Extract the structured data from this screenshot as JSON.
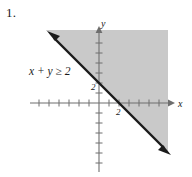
{
  "figure": {
    "problem_number": "1.",
    "inequality": {
      "lhs": "x + y",
      "operator": "≥",
      "rhs": "2",
      "full": "x + y ≥ 2"
    },
    "axes": {
      "x_label": "x",
      "y_label": "y",
      "x_intercept_label": "2",
      "y_intercept_label": "2"
    },
    "colors": {
      "shading": "#c9c9c9",
      "line": "#1a1a1a",
      "axis": "#6e6e6e",
      "text": "#1a1a1a",
      "background": "#ffffff"
    }
  },
  "chart_data": {
    "type": "line",
    "title": "x + y ≥ 2",
    "xlabel": "x",
    "ylabel": "y",
    "boundary_line": {
      "equation": "x + y = 2",
      "slope": -1,
      "intercept": 2,
      "style": "solid",
      "arrows": "both"
    },
    "points_labeled": [
      {
        "x": 0,
        "y": 2,
        "label": "2",
        "axis": "y"
      },
      {
        "x": 2,
        "y": 0,
        "label": "2",
        "axis": "x"
      }
    ],
    "shaded_region": "above-right of boundary line (x + y ≥ 2)",
    "xlim": [
      -7,
      7
    ],
    "ylim": [
      -7,
      7
    ],
    "grid": false,
    "legend": "none"
  }
}
